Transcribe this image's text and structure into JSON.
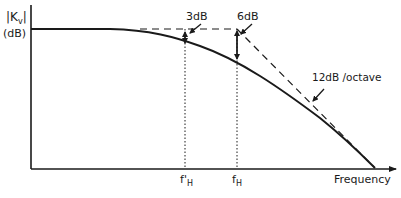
{
  "diagram": {
    "y_axis": {
      "label_top": "|K",
      "label_sub": "v",
      "label_close": "|",
      "units": "(dB)"
    },
    "x_axis": {
      "label": "Frequency"
    },
    "markers": [
      {
        "id": "f_prime_H",
        "label": "f",
        "prime": "'",
        "subscript": "H"
      },
      {
        "id": "f_H",
        "label": "f",
        "prime": "",
        "subscript": "H"
      }
    ],
    "annotations": {
      "three_db": "3dB",
      "six_db": "6dB",
      "slope": "12dB /octave"
    },
    "colors": {
      "ink": "#1a1a1a",
      "background": "#ffffff"
    }
  }
}
